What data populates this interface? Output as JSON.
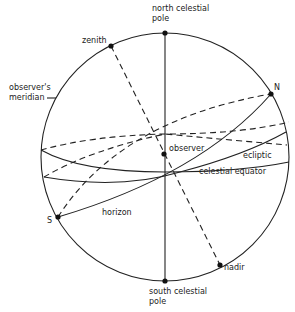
{
  "diagram": {
    "labels": {
      "north_celestial_pole": "north celestial",
      "north_celestial_pole_2": "pole",
      "south_celestial_pole": "south celestial",
      "south_celestial_pole_2": "pole",
      "zenith": "zenith",
      "nadir": "nadir",
      "observers_meridian": "observer's",
      "observers_meridian_2": "meridian",
      "north_point": "N",
      "south_point": "S",
      "observer": "observer",
      "ecliptic": "ecliptic",
      "celestial_equator": "celestial equator",
      "horizon": "horizon"
    },
    "colors": {
      "line": "#222222",
      "background": "#ffffff"
    }
  }
}
